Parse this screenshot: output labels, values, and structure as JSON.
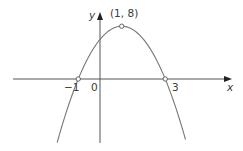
{
  "chart_data": {
    "type": "line",
    "title": "",
    "xlabel": "x",
    "ylabel": "y",
    "equation": "y = -2x^2 + 4x + 6",
    "series": [
      {
        "name": "parabola",
        "x": [
          -1.97,
          -1.5,
          -1,
          -0.5,
          0,
          0.5,
          1,
          1.5,
          2,
          2.5,
          3,
          3.5,
          3.97
        ],
        "values": [
          -9.6,
          -4.5,
          0,
          3.5,
          6,
          7.5,
          8,
          7.5,
          6,
          3.5,
          0,
          -4.5,
          -9.6
        ]
      }
    ],
    "annotations": [
      {
        "label": "(1, 8)",
        "x": 1,
        "y": 8,
        "marker": "open-circle"
      },
      {
        "label": "-1",
        "x": -1,
        "y": 0,
        "marker": "open-circle"
      },
      {
        "label": "3",
        "x": 3,
        "y": 0,
        "marker": "open-circle"
      },
      {
        "label": "0",
        "x": 0,
        "y": 0,
        "marker": "none"
      }
    ],
    "xlim": [
      -4,
      5.9
    ],
    "ylim": [
      -9.7,
      10
    ],
    "grid": false,
    "legend": "none"
  },
  "labels": {
    "x_axis": "x",
    "y_axis": "y",
    "origin": "0",
    "vertex": "(1, 8)",
    "root_left": "−1",
    "root_right": "3"
  }
}
